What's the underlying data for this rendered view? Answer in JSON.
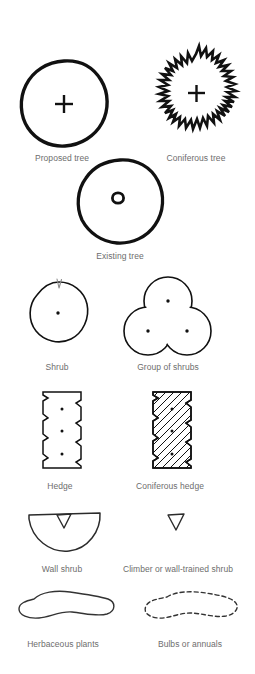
{
  "page": {
    "background_color": "#ffffff",
    "ink_color": "#111111",
    "caption_color": "#6d6d6d",
    "width": 255,
    "height": 674
  },
  "symbols": [
    {
      "id": "proposed-tree",
      "label": "Proposed tree",
      "glyph": "hand-drawn circle with centred plus mark",
      "caption_x": 62,
      "caption_y": 153
    },
    {
      "id": "coniferous-tree",
      "label": "Coniferous tree",
      "glyph": "spiky star outline with centred plus mark",
      "caption_x": 196,
      "caption_y": 153
    },
    {
      "id": "existing-tree",
      "label": "Existing tree",
      "glyph": "hand-drawn circle with small open ring at centre",
      "caption_x": 120,
      "caption_y": 251
    },
    {
      "id": "shrub",
      "label": "Shrub",
      "glyph": "thin circle with centre dot and small tick at top",
      "caption_x": 57,
      "caption_y": 362
    },
    {
      "id": "group-of-shrubs",
      "label": "Group of shrubs",
      "glyph": "three overlapping circles, clover outline, dot in each",
      "caption_x": 168,
      "caption_y": 362
    },
    {
      "id": "hedge",
      "label": "Hedge",
      "glyph": "tall rectangle with notched sides and three dots",
      "caption_x": 60,
      "caption_y": 481
    },
    {
      "id": "coniferous-hedge",
      "label": "Coniferous hedge",
      "glyph": "tall notched rectangle filled with diagonal hatching",
      "caption_x": 170,
      "caption_y": 481
    },
    {
      "id": "wall-shrub",
      "label": "Wall shrub",
      "glyph": "semicircle flat side up with small triangle at top centre",
      "caption_x": 62,
      "caption_y": 564
    },
    {
      "id": "climber-or-wall-trained-shrub",
      "label": "Climber or wall-trained shrub",
      "glyph": "small downward pointing triangle outline",
      "caption_x": 178,
      "caption_y": 564
    },
    {
      "id": "herbaceous-plants",
      "label": "Herbaceous plants",
      "glyph": "irregular solid-outline amoeba blob",
      "caption_x": 63,
      "caption_y": 639
    },
    {
      "id": "bulbs-or-annuals",
      "label": "Bulbs or annuals",
      "glyph": "irregular dashed-outline amoeba blob",
      "caption_x": 190,
      "caption_y": 639
    }
  ]
}
